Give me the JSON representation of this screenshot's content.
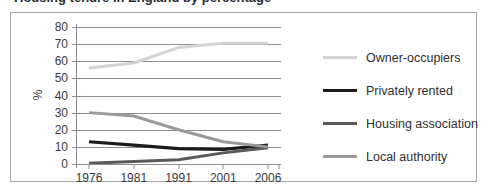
{
  "figure": {
    "clipped_title": "Housing tenure in England by percentage"
  },
  "chart_data": {
    "type": "line",
    "title": "",
    "xlabel": "",
    "ylabel": "%",
    "x": [
      "1976",
      "1981",
      "1991",
      "2001",
      "2006"
    ],
    "ylim": [
      0,
      80
    ],
    "yticks": [
      0,
      10,
      20,
      30,
      40,
      50,
      60,
      70,
      80
    ],
    "grid": true,
    "legend_position": "right",
    "series": [
      {
        "name": "Owner-occupiers",
        "color": "#d4d4d4",
        "width": 3,
        "values": [
          56,
          59,
          68,
          70.5,
          70.5
        ]
      },
      {
        "name": "Privately rented",
        "color": "#1a1a1a",
        "width": 3.2,
        "values": [
          13,
          11,
          9,
          8.5,
          11
        ]
      },
      {
        "name": "Housing association",
        "color": "#595959",
        "width": 3,
        "values": [
          0.5,
          1.5,
          2.5,
          6.5,
          9.5
        ]
      },
      {
        "name": "Local authority",
        "color": "#9a9a9a",
        "width": 3,
        "values": [
          30,
          28,
          20,
          13,
          10
        ]
      }
    ]
  },
  "legend": {
    "items": [
      {
        "label": "Owner-occupiers"
      },
      {
        "label": "Privately rented"
      },
      {
        "label": "Housing association"
      },
      {
        "label": "Local authority"
      }
    ]
  }
}
